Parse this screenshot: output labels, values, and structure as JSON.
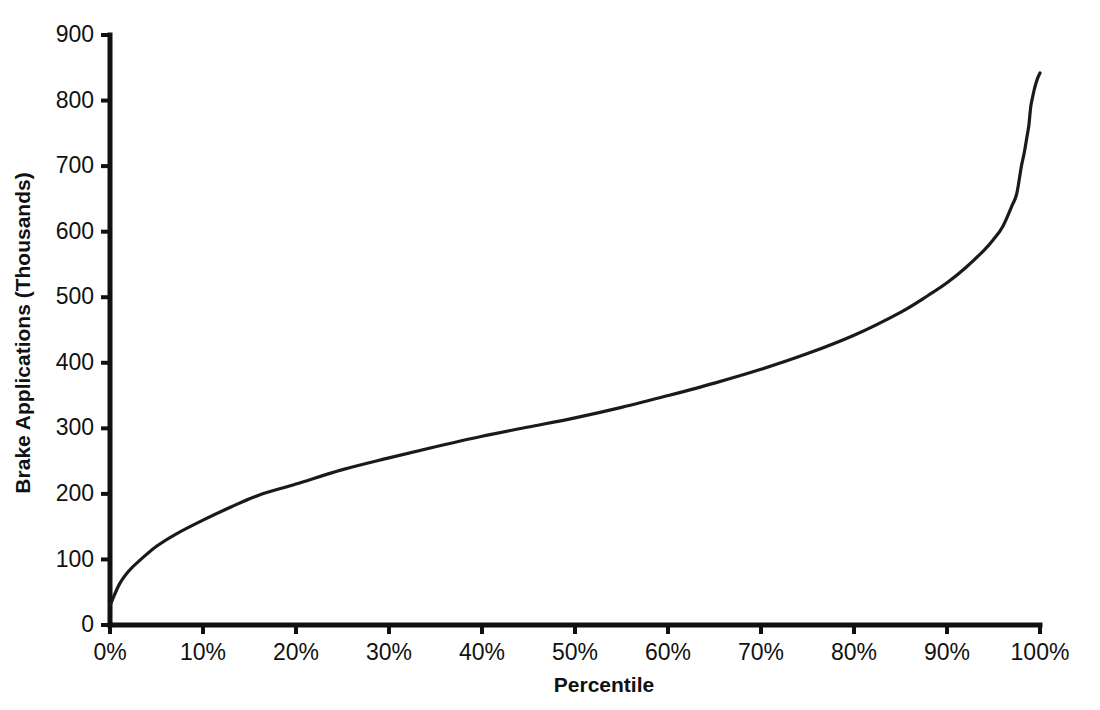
{
  "chart_data": {
    "type": "line",
    "title": "",
    "xlabel": "Percentile",
    "ylabel": "Brake Applications (Thousands)",
    "xlim": [
      0,
      100
    ],
    "ylim": [
      0,
      900
    ],
    "grid": false,
    "legend": "none",
    "x_tick_labels": [
      "0%",
      "10%",
      "20%",
      "30%",
      "40%",
      "50%",
      "60%",
      "70%",
      "80%",
      "90%",
      "100%"
    ],
    "x_tick_values": [
      0,
      10,
      20,
      30,
      40,
      50,
      60,
      70,
      80,
      90,
      100
    ],
    "y_tick_labels": [
      "0",
      "100",
      "200",
      "300",
      "400",
      "500",
      "600",
      "700",
      "800",
      "900"
    ],
    "y_tick_values": [
      0,
      100,
      200,
      300,
      400,
      500,
      600,
      700,
      800,
      900
    ],
    "series": [
      {
        "name": "Brake Applications",
        "color": "#1a1a1a",
        "x": [
          0,
          1,
          2,
          3,
          5,
          7,
          10,
          13,
          16,
          20,
          25,
          30,
          35,
          40,
          45,
          50,
          55,
          60,
          65,
          70,
          75,
          80,
          85,
          88,
          90,
          92,
          94,
          95,
          96,
          97,
          97.5,
          98,
          98.3,
          98.6,
          98.8,
          99,
          99.2,
          99.4,
          99.6,
          99.8,
          100
        ],
        "y": [
          30,
          62,
          82,
          96,
          120,
          138,
          160,
          180,
          198,
          215,
          237,
          255,
          272,
          288,
          302,
          316,
          332,
          350,
          369,
          390,
          414,
          442,
          477,
          503,
          522,
          545,
          572,
          588,
          608,
          640,
          658,
          700,
          720,
          745,
          762,
          790,
          805,
          818,
          828,
          836,
          842
        ]
      }
    ],
    "annotations": []
  },
  "axes": {
    "x_title": "Percentile",
    "y_title": "Brake Applications (Thousands)"
  },
  "colors": {
    "background": "#ffffff",
    "axis": "#111111",
    "curve": "#1a1a1a"
  }
}
